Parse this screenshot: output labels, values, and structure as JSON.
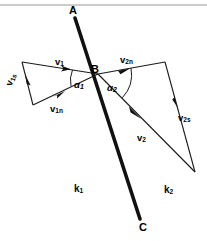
{
  "figure": {
    "colors": {
      "ink": "#000000",
      "background": "#ffffff",
      "rule": "#9a9a9a",
      "interface_line": "#111111",
      "vector_line": "#1a1a1a"
    },
    "points": {
      "a": {
        "label": "A",
        "x": 72,
        "y": 11
      },
      "b": {
        "label": "B",
        "x": 94,
        "y": 71
      },
      "c": {
        "label": "C",
        "x": 142,
        "y": 228
      }
    },
    "media": [
      {
        "label": "k",
        "subscript": "1",
        "x": 74,
        "y": 184
      },
      {
        "label": "k",
        "subscript": "2",
        "x": 164,
        "y": 185
      }
    ],
    "angles": [
      {
        "label": "α",
        "subscript": "1",
        "x": 74,
        "y": 80
      },
      {
        "label": "α",
        "subscript": "2",
        "x": 107,
        "y": 83
      }
    ],
    "vectors": [
      {
        "name": "v1",
        "label": "v",
        "subscript": "1",
        "x": 55,
        "y": 57
      },
      {
        "name": "v1s",
        "label": "v",
        "subscript": "1s",
        "x": 4,
        "y": 84
      },
      {
        "name": "v1n",
        "label": "v",
        "subscript": "1n",
        "x": 50,
        "y": 104
      },
      {
        "name": "v2n",
        "label": "v",
        "subscript": "2n",
        "x": 120,
        "y": 55
      },
      {
        "name": "v2s",
        "label": "v",
        "subscript": "2s",
        "x": 178,
        "y": 113
      },
      {
        "name": "v2",
        "label": "v",
        "subscript": "2",
        "x": 137,
        "y": 133
      }
    ],
    "geometry": {
      "top_rule": {
        "x1": 0,
        "y1": 5,
        "x2": 207,
        "y2": 5
      },
      "interface": {
        "x1": 75,
        "y1": 18,
        "x2": 140,
        "y2": 219
      },
      "left_triangle": {
        "apex": {
          "x": 98,
          "y": 74
        },
        "top_left": {
          "x": 22,
          "y": 62
        },
        "bottom_left": {
          "x": 33,
          "y": 105
        }
      },
      "right_triangle": {
        "apex": {
          "x": 98,
          "y": 74
        },
        "top_right": {
          "x": 165,
          "y": 62
        },
        "bottom_right": {
          "x": 195,
          "y": 172
        }
      }
    }
  }
}
